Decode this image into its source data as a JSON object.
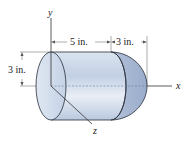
{
  "diagram": {
    "type": "3d-solid-figure",
    "axes": {
      "x_label": "x",
      "y_label": "y",
      "z_label": "z"
    },
    "dimensions": {
      "cylinder_length": "5 in.",
      "hemisphere_length": "3 in.",
      "radius": "3 in."
    },
    "colors": {
      "body_fill": "#c5d3e6",
      "body_highlight": "#eef2f8",
      "cap_fill": "#a9b9d4",
      "outline": "#2a2f3a",
      "axis": "#333333",
      "dimension_line": "#666666"
    }
  }
}
